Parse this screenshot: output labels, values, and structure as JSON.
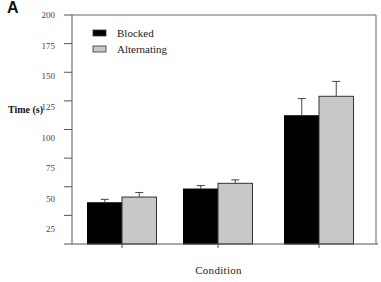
{
  "panel_label": "A",
  "chart_data": {
    "type": "bar",
    "title": "",
    "xlabel": "Condition",
    "ylabel": "Time (s)",
    "ylim": [
      0,
      200
    ],
    "yticks": [
      200,
      175,
      150,
      125,
      100,
      75,
      50,
      25
    ],
    "categories": [
      "",
      "",
      ""
    ],
    "series": [
      {
        "name": "Blocked",
        "color": "#000000",
        "values": [
          36,
          48,
          112
        ],
        "error": [
          3,
          3,
          15
        ]
      },
      {
        "name": "Alternating",
        "color": "#c8c8c8",
        "values": [
          41,
          53,
          129
        ],
        "error": [
          4,
          3,
          13
        ]
      }
    ],
    "legend": {
      "position": "upper-left",
      "entries": [
        "Blocked",
        "Alternating"
      ]
    },
    "grid": false,
    "frame": true
  }
}
